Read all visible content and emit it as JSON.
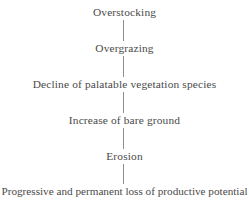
{
  "diagram": {
    "orientation": "vertical-top-to-bottom",
    "background_color": "#ffffff",
    "text_color": "#4a4a4a",
    "connector_color": "#8e8e8e",
    "nodes": [
      {
        "id": "overstocking",
        "label": "Overstocking",
        "top": 5
      },
      {
        "id": "overgrazing",
        "label": "Overgrazing",
        "top": 41
      },
      {
        "id": "decline-palatable-vegetation",
        "label": "Decline of palatable vegetation species",
        "top": 77
      },
      {
        "id": "increase-bare-ground",
        "label": "Increase of bare ground",
        "top": 113
      },
      {
        "id": "erosion",
        "label": "Erosion",
        "top": 149
      },
      {
        "id": "loss-productive-potential",
        "label": "Progressive and permanent loss of productive potential",
        "top": 184
      }
    ],
    "connectors": [
      {
        "id": "connector-1",
        "from": "overstocking",
        "to": "overgrazing",
        "top": 19,
        "height": 23
      },
      {
        "id": "connector-2",
        "from": "overgrazing",
        "to": "decline-palatable-vegetation",
        "top": 55,
        "height": 23
      },
      {
        "id": "connector-3",
        "from": "decline-palatable-vegetation",
        "to": "increase-bare-ground",
        "top": 91,
        "height": 23
      },
      {
        "id": "connector-4",
        "from": "increase-bare-ground",
        "to": "erosion",
        "top": 127,
        "height": 23
      },
      {
        "id": "connector-5",
        "from": "erosion",
        "to": "loss-productive-potential",
        "top": 163,
        "height": 22
      }
    ]
  }
}
